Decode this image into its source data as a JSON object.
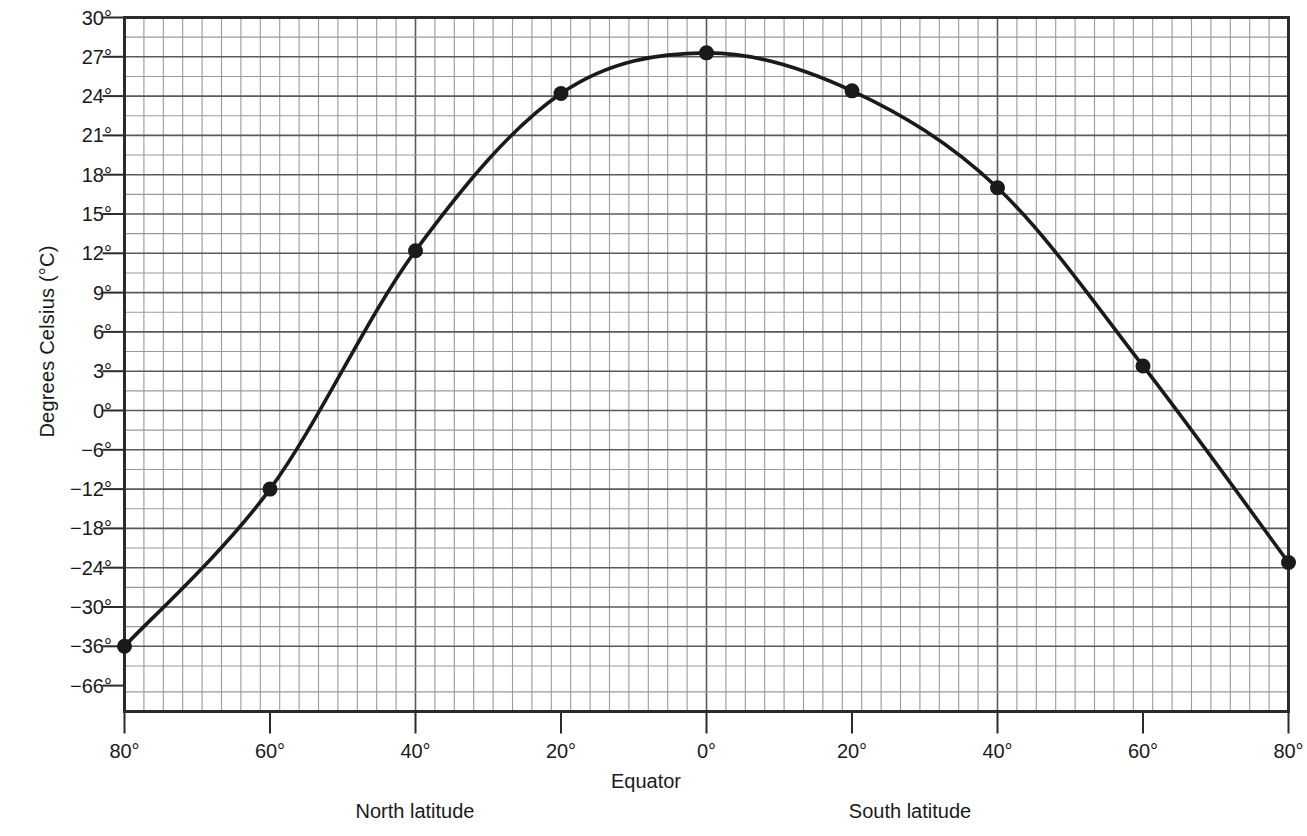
{
  "chart_data": {
    "type": "line",
    "title": "",
    "subtitle": "",
    "xlabel": "Equator",
    "ylabel": "Degrees Celsius (°C)",
    "grid": true,
    "legend": null,
    "x_axis": {
      "tick_labels": [
        "80°",
        "60°",
        "40°",
        "20°",
        "0°",
        "20°",
        "40°",
        "60°",
        "80°"
      ],
      "tick_values": [
        -80,
        -60,
        -40,
        -20,
        0,
        20,
        40,
        60,
        80
      ],
      "captions": [
        "North latitude",
        "Equator",
        "South latitude"
      ],
      "minor_gridlines_per_major": 7.5
    },
    "y_axis": {
      "tick_labels": [
        "30°",
        "27°",
        "24°",
        "21°",
        "18°",
        "15°",
        "12°",
        "9°",
        "6°",
        "3°",
        "0°",
        "−6°",
        "−12°",
        "−18°",
        "−24°",
        "−30°",
        "−36°",
        "−66°"
      ],
      "tick_values": [
        30,
        27,
        24,
        21,
        18,
        15,
        12,
        9,
        6,
        3,
        0,
        -6,
        -12,
        -18,
        -24,
        -30,
        -36,
        -66
      ],
      "ylim": [
        -66,
        30
      ],
      "units": "°C"
    },
    "series": [
      {
        "name": "Mean annual temperature by latitude",
        "marker": "filled-circle",
        "line_color": "#1a1a1a",
        "points": [
          {
            "latitude_label": "80° N",
            "x": -80,
            "y": -36.0
          },
          {
            "latitude_label": "60° N",
            "x": -60,
            "y": -12.0
          },
          {
            "latitude_label": "40° N",
            "x": -40,
            "y": 12.2
          },
          {
            "latitude_label": "20° N",
            "x": -20,
            "y": 24.2
          },
          {
            "latitude_label": "0° Equator",
            "x": 0,
            "y": 27.3
          },
          {
            "latitude_label": "20° S",
            "x": 20,
            "y": 24.4
          },
          {
            "latitude_label": "40° S",
            "x": 40,
            "y": 17.0
          },
          {
            "latitude_label": "60° S",
            "x": 60,
            "y": 3.4
          },
          {
            "latitude_label": "80° S",
            "x": 80,
            "y": -23.2
          }
        ]
      }
    ]
  },
  "axis": {
    "y_title": "Degrees Celsius (°C)"
  },
  "captions": {
    "equator": "Equator",
    "north": "North latitude",
    "south": "South latitude"
  },
  "colors": {
    "curve": "#1a1a1a",
    "frame": "#2b2b2b",
    "grid_major": "#5a5a5a",
    "grid_minor": "#9a9a9a",
    "background": "#ffffff",
    "text": "#1a1a1a"
  }
}
